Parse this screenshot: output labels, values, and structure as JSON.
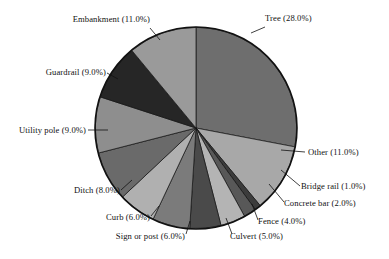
{
  "chart_data": {
    "type": "pie",
    "title": "",
    "subtitle": "",
    "xlabel": "",
    "ylabel": "",
    "legend_position": "none",
    "grid": false,
    "start_angle_deg": 0,
    "direction": "clockwise",
    "value_unit": "percent",
    "categories": [
      "Tree",
      "Other",
      "Bridge rail",
      "Concrete bar",
      "Fence",
      "Culvert",
      "Sign or post",
      "Curb",
      "Ditch",
      "Utility pole",
      "Guardrail",
      "Embankment"
    ],
    "values": [
      28.0,
      11.0,
      1.0,
      2.0,
      4.0,
      5.0,
      6.0,
      6.0,
      8.0,
      9.0,
      9.0,
      11.0
    ],
    "labels": [
      "Tree (28.0%)",
      "Other (11.0%)",
      "Bridge rail (1.0%)",
      "Concrete bar (2.0%)",
      "Fence (4.0%)",
      "Culvert (5.0%)",
      "Sign or post (6.0%)",
      "Curb (6.0%)",
      "Ditch (8.0%)",
      "Utility pole (9.0%)",
      "Guardrail (9.0%)",
      "Embankment (11.0%)"
    ],
    "colors": [
      "#6e6e6e",
      "#a8a8a8",
      "#3c3c3c",
      "#585858",
      "#b4b4b4",
      "#4a4a4a",
      "#7b7b7b",
      "#b0b0b0",
      "#6a6a6a",
      "#8e8e8e",
      "#262626",
      "#9a9a9a"
    ],
    "slice_border_color": "#111111",
    "outline_color": "#111111",
    "background": "#ffffff"
  },
  "slices": [
    {
      "label": "Tree (28.0%)",
      "value": 28.0,
      "color": "#6e6e6e"
    },
    {
      "label": "Other (11.0%)",
      "value": 11.0,
      "color": "#a8a8a8"
    },
    {
      "label": "Bridge rail (1.0%)",
      "value": 1.0,
      "color": "#3c3c3c"
    },
    {
      "label": "Concrete bar (2.0%)",
      "value": 2.0,
      "color": "#585858"
    },
    {
      "label": "Fence (4.0%)",
      "value": 4.0,
      "color": "#b4b4b4"
    },
    {
      "label": "Culvert (5.0%)",
      "value": 5.0,
      "color": "#4a4a4a"
    },
    {
      "label": "Sign or post (6.0%)",
      "value": 6.0,
      "color": "#7b7b7b"
    },
    {
      "label": "Curb (6.0%)",
      "value": 6.0,
      "color": "#b0b0b0"
    },
    {
      "label": "Ditch (8.0%)",
      "value": 8.0,
      "color": "#6a6a6a"
    },
    {
      "label": "Utility pole (9.0%)",
      "value": 9.0,
      "color": "#8e8e8e"
    },
    {
      "label": "Guardrail (9.0%)",
      "value": 9.0,
      "color": "#262626"
    },
    {
      "label": "Embankment (11.0%)",
      "value": 11.0,
      "color": "#9a9a9a"
    }
  ],
  "labels": {
    "tree": "Tree (28.0%)",
    "other": "Other (11.0%)",
    "bridge_rail": "Bridge rail (1.0%)",
    "concrete_bar": "Concrete bar (2.0%)",
    "fence": "Fence (4.0%)",
    "culvert": "Culvert (5.0%)",
    "sign_or_post": "Sign or post (6.0%)",
    "curb": "Curb (6.0%)",
    "ditch": "Ditch (8.0%)",
    "utility_pole": "Utility pole (9.0%)",
    "guardrail": "Guardrail (9.0%)",
    "embankment": "Embankment (11.0%)"
  }
}
